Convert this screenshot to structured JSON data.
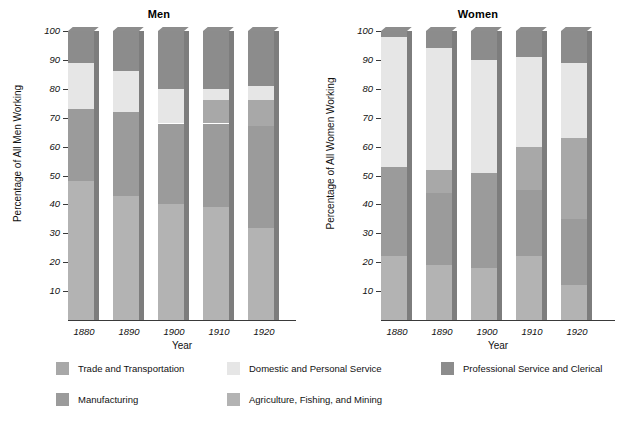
{
  "chart_data": {
    "type": "bar",
    "subtype": "stacked-bar-100-percent",
    "title": "",
    "panels": [
      {
        "title": "Men",
        "ylabel": "Percentage of All Men Working",
        "xlabel": "Year",
        "categories": [
          "1880",
          "1890",
          "1900",
          "1910",
          "1920"
        ],
        "ylim": [
          0,
          100
        ],
        "yticks": [
          10,
          20,
          30,
          40,
          50,
          60,
          70,
          80,
          90,
          100
        ],
        "series": [
          {
            "name": "Agriculture, Fishing, and Mining",
            "values": [
              48,
              43,
              40,
              39,
              32
            ]
          },
          {
            "name": "Manufacturing",
            "values": [
              25,
              29,
              28,
              29,
              35
            ]
          },
          {
            "name": "Trade and Transportation",
            "values": [
              0,
              0,
              0,
              8,
              9
            ]
          },
          {
            "name": "Domestic and Personal Service",
            "values": [
              16,
              14,
              12,
              4,
              5
            ]
          },
          {
            "name": "Professional Service and Clerical",
            "values": [
              11,
              14,
              20,
              20,
              19
            ]
          }
        ]
      },
      {
        "title": "Women",
        "ylabel": "Percentage of All Women Working",
        "xlabel": "Year",
        "categories": [
          "1880",
          "1890",
          "1900",
          "1910",
          "1920"
        ],
        "ylim": [
          0,
          100
        ],
        "yticks": [
          10,
          20,
          30,
          40,
          50,
          60,
          70,
          80,
          90,
          100
        ],
        "series": [
          {
            "name": "Agriculture, Fishing, and Mining",
            "values": [
              22,
              19,
              18,
              22,
              12
            ]
          },
          {
            "name": "Manufacturing",
            "values": [
              31,
              25,
              33,
              23,
              23
            ]
          },
          {
            "name": "Trade and Transportation",
            "values": [
              0,
              8,
              0,
              15,
              28
            ]
          },
          {
            "name": "Domestic and Personal Service",
            "values": [
              45,
              42,
              39,
              31,
              26
            ]
          },
          {
            "name": "Professional Service and Clerical",
            "values": [
              2,
              6,
              10,
              9,
              11
            ]
          }
        ]
      }
    ],
    "legend": {
      "position": "bottom",
      "entries": [
        {
          "label": "Trade and Transportation",
          "color": "#a8a8a8"
        },
        {
          "label": "Domestic and Personal Service",
          "color": "#e6e6e6"
        },
        {
          "label": "Professional Service and Clerical",
          "color": "#8c8c8c"
        },
        {
          "label": "Manufacturing",
          "color": "#9b9b9b"
        },
        {
          "label": "Agriculture, Fishing, and Mining",
          "color": "#b3b3b3"
        }
      ]
    },
    "grid": false,
    "colors": {
      "trade": "#a8a8a8",
      "domestic": "#e6e6e6",
      "professional": "#8c8c8c",
      "manufacturing": "#9b9b9b",
      "agriculture": "#b3b3b3",
      "bar_side": "#7d7d7d",
      "axis": "#3a3a3a",
      "background": "#ffffff"
    }
  },
  "axes": {
    "ytick_labels": [
      "100",
      "90",
      "80",
      "70",
      "60",
      "50",
      "40",
      "30",
      "20",
      "10"
    ],
    "xtick_labels": [
      "1880",
      "1890",
      "1900",
      "1910",
      "1920"
    ]
  }
}
